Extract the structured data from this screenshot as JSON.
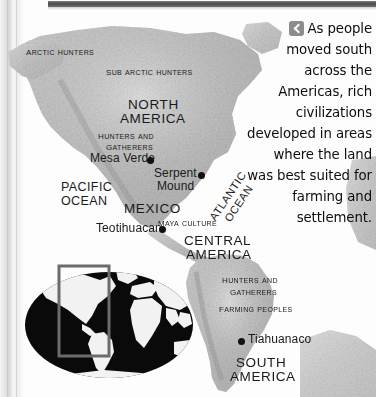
{
  "page": {
    "kind": "textbook-page-scan",
    "background_color": "#ffffff",
    "header_bar_color": "#4a4a4a"
  },
  "caption": {
    "icon": "chevron-left-icon",
    "icon_bg": "#8c8c8c",
    "text": "As people moved south across the Americas, rich civilizations developed in areas where the land was best suited for farming and settlement."
  },
  "map": {
    "type": "shaded-relief-map",
    "land_color": "#c9c9c9",
    "ocean_color": "#ffffff",
    "labels": {
      "arctic_hunters": "Arctic hunters",
      "sub_arctic_hunters": "Sub Arctic hunters",
      "north_america": "NORTH\nAMERICA",
      "north_america_line1": "NORTH",
      "north_america_line2": "AMERICA",
      "hunters_and_gatherers_na_line1": "Hunters and",
      "hunters_and_gatherers_na_line2": "gatherers",
      "pacific_ocean_line1": "PACIFIC",
      "pacific_ocean_line2": "OCEAN",
      "atlantic_ocean_line1": "ATLANTIC",
      "atlantic_ocean_line2": "OCEAN",
      "mexico": "MEXICO",
      "maya_culture": "Maya culture",
      "central_america_line1": "CENTRAL",
      "central_america_line2": "AMERICA",
      "hunters_and_gatherers_sa_line1": "Hunters and",
      "hunters_and_gatherers_sa_line2": "gatherers",
      "farming_peoples": "Farming peoples",
      "south_america_line1": "SOUTH",
      "south_america_line2": "AMERICA"
    },
    "sites": [
      {
        "name": "Mesa Verde",
        "label_side": "left"
      },
      {
        "name": "Serpent Mound",
        "label_line1": "Serpent",
        "label_line2": "Mound",
        "label_side": "left"
      },
      {
        "name": "Teotihuacan",
        "label_side": "left"
      },
      {
        "name": "Tiahuanaco",
        "label_side": "right"
      }
    ]
  },
  "inset": {
    "type": "world-locator-map",
    "ocean_color": "#0a0a0a",
    "land_color": "#f5f5f5",
    "highlight_rect_color": "#6b6b6b",
    "highlight_region": "Americas"
  }
}
